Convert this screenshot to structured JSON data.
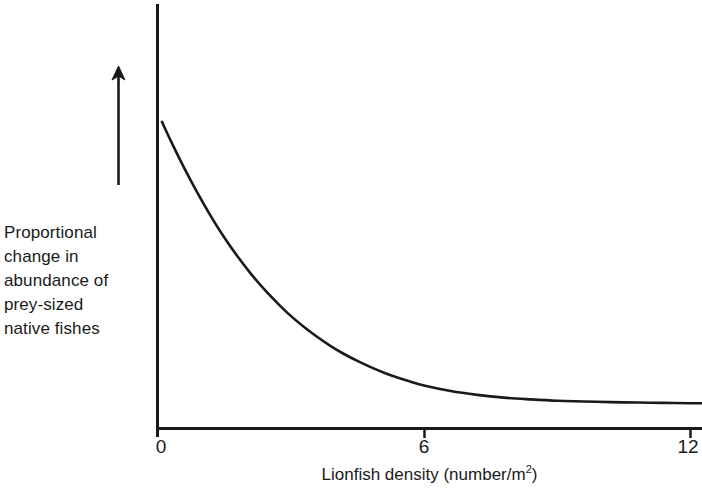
{
  "figure": {
    "background_color": "#ffffff",
    "ink_color": "#1a1a1a"
  },
  "chart_data": {
    "type": "line",
    "title": "",
    "subtitle": "",
    "xlabel": "Lionfish density (number/m",
    "xlabel_superscript": "2",
    "xlabel_suffix": ")",
    "xlabel_full": "Lionfish density (number/m2)",
    "ylabel": "Proportional\nchange in\nabundance of\nprey-sized\nnative fishes",
    "ylabel_lines": [
      "Proportional",
      "change in",
      "abundance of",
      "prey-sized",
      "native fishes"
    ],
    "y_axis_direction_annotation": "upward-arrow",
    "xticks": [
      0,
      6,
      12
    ],
    "xtick_labels": [
      "0",
      "6",
      "12"
    ],
    "yticks": [],
    "ytick_labels": [],
    "xlim": [
      0,
      12.3
    ],
    "ylim": [
      0,
      1
    ],
    "grid": false,
    "legend": null,
    "series": [
      {
        "name": "Proportional change in abundance of prey-sized native fishes",
        "description": "Exponential decay from a high value near zero lionfish density to a low asymptote",
        "x": [
          0.1,
          0.3,
          0.6,
          0.9,
          1.2,
          1.5,
          1.8,
          2.1,
          2.4,
          2.7,
          3.0,
          3.3,
          3.6,
          3.9,
          4.2,
          4.5,
          4.8,
          5.1,
          5.4,
          5.7,
          6.0,
          6.6,
          7.2,
          7.8,
          8.4,
          9.0,
          9.6,
          10.2,
          10.8,
          11.4,
          12.0,
          12.3
        ],
        "y": [
          0.885,
          0.83,
          0.752,
          0.68,
          0.613,
          0.552,
          0.497,
          0.447,
          0.402,
          0.362,
          0.325,
          0.293,
          0.264,
          0.238,
          0.215,
          0.195,
          0.177,
          0.161,
          0.147,
          0.135,
          0.124,
          0.108,
          0.097,
          0.089,
          0.084,
          0.08,
          0.078,
          0.076,
          0.075,
          0.074,
          0.073,
          0.073
        ]
      }
    ]
  },
  "axes": {
    "x_axis_name": "x-axis",
    "y_axis_name": "y-axis",
    "arrow_name": "increase-direction-arrow"
  }
}
